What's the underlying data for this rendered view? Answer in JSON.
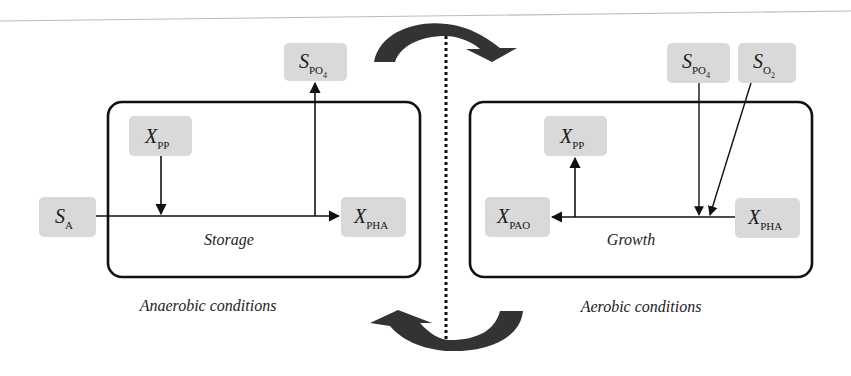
{
  "diagram": {
    "colors": {
      "box_fill": "#d9d9d9",
      "stroke": "#111111",
      "arrow_fill": "#333333",
      "rule": "#bdbdbd"
    },
    "left_panel": {
      "process_label": "Storage",
      "condition_label": "Anaerobic conditions",
      "nodes": {
        "s_a": {
          "main": "S",
          "sub": "A"
        },
        "x_pp": {
          "main": "X",
          "sub": "PP"
        },
        "s_po4": {
          "main": "S",
          "sub": "PO",
          "subsub": "4"
        },
        "x_pha": {
          "main": "X",
          "sub": "PHA"
        }
      }
    },
    "right_panel": {
      "process_label": "Growth",
      "condition_label": "Aerobic conditions",
      "nodes": {
        "x_pp": {
          "main": "X",
          "sub": "PP"
        },
        "x_pao": {
          "main": "X",
          "sub": "PAO"
        },
        "s_po4": {
          "main": "S",
          "sub": "PO",
          "subsub": "4"
        },
        "s_o2": {
          "main": "S",
          "sub": "O",
          "subsub": "2"
        },
        "x_pha": {
          "main": "X",
          "sub": "PHA"
        }
      }
    }
  }
}
